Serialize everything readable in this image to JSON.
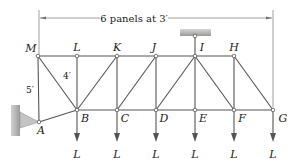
{
  "diagram": {
    "type": "truss",
    "dimension_label": "6 panels at 3′",
    "panel_height_label": "4′",
    "support_offset_label": "5′",
    "load_label": "L",
    "colors": {
      "member": "#555555",
      "support_fill": "#b5b5b5",
      "text": "#222222"
    },
    "nodes": {
      "top": [
        {
          "name": "M",
          "x": 38,
          "y": 56
        },
        {
          "name": "L",
          "x": 77,
          "y": 56
        },
        {
          "name": "K",
          "x": 117,
          "y": 56
        },
        {
          "name": "J",
          "x": 156,
          "y": 56
        },
        {
          "name": "I",
          "x": 195,
          "y": 56
        },
        {
          "name": "H",
          "x": 234,
          "y": 56
        }
      ],
      "bottom": [
        {
          "name": "B",
          "x": 77,
          "y": 110
        },
        {
          "name": "C",
          "x": 117,
          "y": 110
        },
        {
          "name": "D",
          "x": 156,
          "y": 110
        },
        {
          "name": "E",
          "x": 195,
          "y": 110
        },
        {
          "name": "F",
          "x": 234,
          "y": 110
        },
        {
          "name": "G",
          "x": 273,
          "y": 110
        }
      ],
      "support": {
        "name": "A",
        "x": 39,
        "y": 122
      }
    },
    "loads": [
      "L",
      "L",
      "L",
      "L",
      "L",
      "L"
    ]
  }
}
